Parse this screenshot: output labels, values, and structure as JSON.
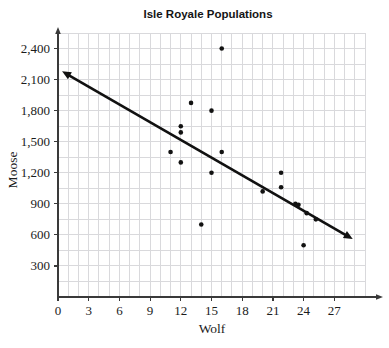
{
  "chart_data": {
    "type": "scatter",
    "title": "Isle Royale Populations",
    "xlabel": "Wolf",
    "ylabel": "Moose",
    "xlim": [
      0,
      30
    ],
    "ylim": [
      0,
      2550
    ],
    "grid": true,
    "grid_x_step": 1,
    "grid_y_step": 150,
    "legend": "none",
    "xticks": [
      "0",
      "3",
      "6",
      "9",
      "12",
      "15",
      "18",
      "21",
      "24",
      "27"
    ],
    "xtick_values": [
      0,
      3,
      6,
      9,
      12,
      15,
      18,
      21,
      24,
      27
    ],
    "yticks": [
      "300",
      "600",
      "900",
      "1,200",
      "1,500",
      "1,800",
      "2,100",
      "2,400"
    ],
    "ytick_values": [
      300,
      600,
      900,
      1200,
      1500,
      1800,
      2100,
      2400
    ],
    "points": [
      {
        "x": 11,
        "y": 1400
      },
      {
        "x": 12,
        "y": 1650
      },
      {
        "x": 12,
        "y": 1590
      },
      {
        "x": 12,
        "y": 1300
      },
      {
        "x": 13,
        "y": 1875
      },
      {
        "x": 14,
        "y": 700
      },
      {
        "x": 15,
        "y": 1800
      },
      {
        "x": 15,
        "y": 1200
      },
      {
        "x": 16,
        "y": 1400
      },
      {
        "x": 16,
        "y": 2400
      },
      {
        "x": 20,
        "y": 1020
      },
      {
        "x": 21.8,
        "y": 1200
      },
      {
        "x": 21.8,
        "y": 1060
      },
      {
        "x": 23.2,
        "y": 900
      },
      {
        "x": 23.5,
        "y": 890
      },
      {
        "x": 24,
        "y": 500
      },
      {
        "x": 24.3,
        "y": 810
      },
      {
        "x": 25.2,
        "y": 750
      }
    ],
    "trend_line": {
      "label": "line-of-best-fit",
      "x_start": 0.4,
      "y_start": 2180,
      "x_end": 28.8,
      "y_end": 560,
      "arrow_start": true,
      "arrow_end": true
    },
    "point_radius": 2.3,
    "colors": {
      "point": "#121212",
      "trend": "#111111",
      "grid": "#d9d9dc",
      "axis": "#3a3a3a",
      "title": "#141414"
    }
  }
}
